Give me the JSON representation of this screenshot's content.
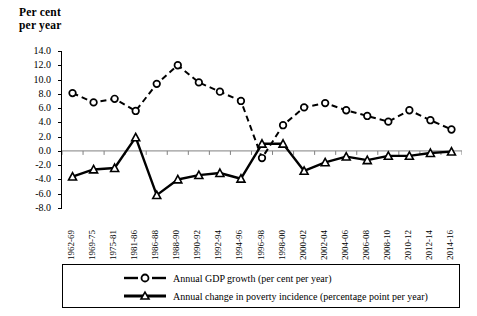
{
  "axis_title": {
    "line1": "Per cent",
    "line2": "per year"
  },
  "legend": {
    "items": [
      {
        "label": "Annual GDP growth (per cent per year)",
        "key": "dashed-open-circle-key",
        "style": "dashed"
      },
      {
        "label": "Annual change in poverty incidence (percentage point per year)",
        "key": "solid-open-triangle-key",
        "style": "solid"
      }
    ]
  },
  "colors": {
    "line": "#000000",
    "axis": "#000000",
    "zero_line": "#808080",
    "background": "#ffffff",
    "marker_fill": "#ffffff"
  },
  "chart_data": {
    "type": "line",
    "title": "",
    "subtitle": "",
    "xlabel": "",
    "ylabel": "Per cent per year",
    "ylim": [
      -8.0,
      14.0
    ],
    "ytick_labels": [
      "14.0",
      "12.0",
      "10.0",
      "8.0",
      "6.0",
      "4.0",
      "2.0",
      "0.0",
      "-2.0",
      "-4.0",
      "-6.0",
      "-8.0"
    ],
    "ytick_values": [
      14.0,
      12.0,
      10.0,
      8.0,
      6.0,
      4.0,
      2.0,
      0.0,
      -2.0,
      -4.0,
      -6.0,
      -8.0
    ],
    "grid": false,
    "legend_position": "bottom",
    "categories": [
      "1962-69",
      "1969-75",
      "1975-81",
      "1981-86",
      "1986-88",
      "1988-90",
      "1990-92",
      "1992-94",
      "1994-96",
      "1996-98",
      "1998-00",
      "2000-02",
      "2002-04",
      "2004-06",
      "2006-08",
      "2008-10",
      "2010-12",
      "2012-14",
      "2014-16"
    ],
    "series": [
      {
        "name": "Annual GDP growth (per cent per year)",
        "marker": "open-circle",
        "linestyle": "dashed",
        "values": [
          8.1,
          6.8,
          7.3,
          5.6,
          9.4,
          12.0,
          9.6,
          8.3,
          7.0,
          -1.0,
          3.6,
          6.1,
          6.7,
          5.7,
          4.9,
          4.1,
          5.7,
          4.3,
          3.0
        ]
      },
      {
        "name": "Annual change in poverty incidence (percentage point per year)",
        "marker": "open-triangle",
        "linestyle": "solid",
        "values": [
          -3.6,
          -2.6,
          -2.4,
          1.9,
          -6.2,
          -4.0,
          -3.4,
          -3.1,
          -3.9,
          1.0,
          1.0,
          -2.8,
          -1.6,
          -0.8,
          -1.3,
          -0.7,
          -0.7,
          -0.3,
          -0.1
        ]
      }
    ]
  }
}
